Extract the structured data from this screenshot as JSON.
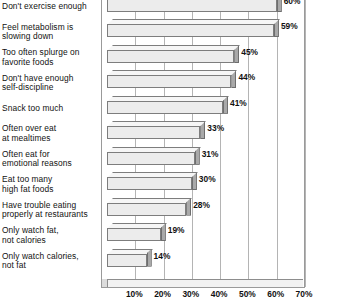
{
  "chart_data": {
    "type": "bar",
    "orientation": "horizontal",
    "title": "",
    "subtitle": "",
    "xlabel": "",
    "ylabel": "",
    "xlim": [
      0,
      70
    ],
    "value_suffix": "%",
    "grid": true,
    "gridlines": [
      10,
      20,
      30,
      40,
      50,
      60,
      70
    ],
    "legend": "none",
    "tick_labels": [
      "10%",
      "20%",
      "30%",
      "40%",
      "50%",
      "60%",
      "70%"
    ],
    "categories": [
      "Don't exercise enough",
      "Feel metabolism is\nslowing down",
      "Too often splurge on\nfavorite foods",
      "Don't have enough\nself-discipline",
      "Snack too much",
      "Often over eat\nat mealtimes",
      "Often eat for\nemotional reasons",
      "Eat too many\nhigh fat foods",
      "Have trouble eating\nproperly at restaurants",
      "Only watch fat,\nnot calories",
      "Only watch calories,\nnot fat"
    ],
    "values": [
      60,
      59,
      45,
      44,
      41,
      33,
      31,
      30,
      28,
      19,
      14
    ],
    "value_labels": [
      "60%",
      "59%",
      "45%",
      "44%",
      "41%",
      "33%",
      "31%",
      "30%",
      "28%",
      "19%",
      "14%"
    ],
    "colors": {
      "bar_front": "#ececec",
      "bar_top": "#f6f6f6",
      "bar_cap": "#a9a9a9",
      "bar_outline": "#7d7d7d",
      "gridline": "#b4b4b4",
      "frame": "#9a9a9a",
      "text": "#111111",
      "background": "#ffffff"
    }
  }
}
